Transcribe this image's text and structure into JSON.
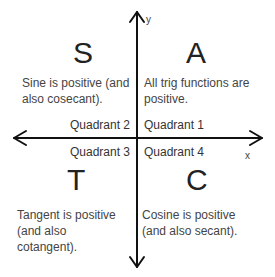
{
  "axes": {
    "x_label": "x",
    "y_label": "y"
  },
  "quadrants": {
    "q1": {
      "letter": "A",
      "label": "Quadrant 1",
      "description": "All trig functions are positive."
    },
    "q2": {
      "letter": "S",
      "label": "Quadrant 2",
      "description": "Sine is positive (and also cosecant)."
    },
    "q3": {
      "letter": "T",
      "label": "Quadrant 3",
      "description": "Tangent is positive (and also cotangent)."
    },
    "q4": {
      "letter": "C",
      "label": "Quadrant 4",
      "description": "Cosine is positive (and also secant)."
    }
  },
  "colors": {
    "axis": "#111111",
    "text": "#333333",
    "background": "#ffffff"
  }
}
